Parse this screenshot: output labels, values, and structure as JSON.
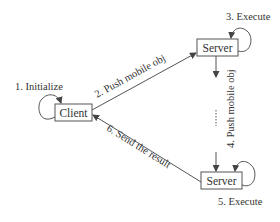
{
  "diagram": {
    "type": "sequence-flow",
    "nodes": {
      "client": {
        "label": "Client"
      },
      "server_top": {
        "label": "Server"
      },
      "server_bottom": {
        "label": "Server"
      }
    },
    "steps": [
      {
        "label": "1. Initialize",
        "from": "client",
        "to": "client"
      },
      {
        "label": "2. Push mobile obj",
        "from": "client",
        "to": "server_top"
      },
      {
        "label": "3. Execute",
        "from": "server_top",
        "to": "server_top"
      },
      {
        "label": "4. Push mobile obj",
        "from": "server_top",
        "to": "server_bottom"
      },
      {
        "label": "5. Execute",
        "from": "server_bottom",
        "to": "server_bottom"
      },
      {
        "label": "6. Send the result",
        "from": "server_bottom",
        "to": "client"
      }
    ],
    "colors": {
      "stroke": "#555555",
      "text": "#333333",
      "background": "#ffffff"
    }
  }
}
